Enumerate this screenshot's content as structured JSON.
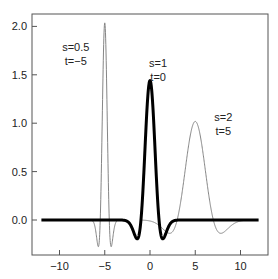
{
  "chart_data": {
    "type": "line",
    "title": "",
    "xlabel": "",
    "ylabel": "",
    "xlim": [
      -13,
      13
    ],
    "ylim": [
      -0.38,
      2.15
    ],
    "grid": false,
    "legend": null,
    "x_ticks": [
      -10,
      -5,
      0,
      5,
      10
    ],
    "x_tick_labels": [
      "−10",
      "−5",
      "0",
      "5",
      "10"
    ],
    "y_ticks": [
      0.0,
      0.5,
      1.0,
      1.5,
      2.0
    ],
    "y_tick_labels": [
      "0.0",
      "0.5",
      "1.0",
      "1.5",
      "2.0"
    ],
    "function": "psi((t - tau)/s)/sqrt(s), psi(u) = 1.44*(1-u^2)*exp(-u^2)",
    "series": [
      {
        "name": "s=0.5, t=-5",
        "scale": 0.5,
        "shift": -5,
        "style": "thin",
        "x_range": [
          -7,
          -3
        ],
        "peak": 2.04,
        "min": -0.26
      },
      {
        "name": "s=1, t=0",
        "scale": 1,
        "shift": 0,
        "style": "bold",
        "x_range": [
          -12,
          12
        ],
        "peak": 1.44,
        "min": -0.19
      },
      {
        "name": "s=2, t=5",
        "scale": 2,
        "shift": 5,
        "style": "thin",
        "x_range": [
          -1,
          11
        ],
        "peak": 1.02,
        "min": -0.14
      }
    ],
    "annotations": [
      {
        "text_lines": [
          "s=0.5",
          "t=−5"
        ],
        "x": -8.2,
        "y": 1.75
      },
      {
        "text_lines": [
          "s=1",
          "t=0"
        ],
        "x": 0.9,
        "y": 1.58
      },
      {
        "text_lines": [
          "s=2",
          "t=5"
        ],
        "x": 8.1,
        "y": 1.02
      }
    ]
  }
}
